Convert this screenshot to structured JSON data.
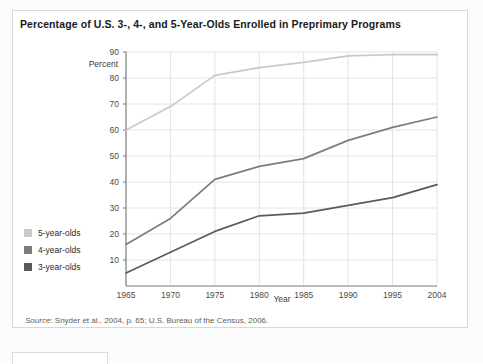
{
  "figure": {
    "title": "Percentage of U.S. 3-, 4-, and 5-Year-Olds Enrolled in Preprimary Programs",
    "source_prefix": "Source",
    "source_text": ": Snyder et al., 2004, p. 65; U.S. Bureau of the Census, 2006."
  },
  "colors": {
    "five_year_olds": "#c9c9c9",
    "four_year_olds": "#7d7d7d",
    "three_year_olds": "#5a5a5a",
    "gridline": "#e3e3e3",
    "axis": "#7a7a7a",
    "card_border": "#d8d8d8",
    "page_background": "#fbfbfb",
    "card_background": "#ffffff"
  },
  "chart_data": {
    "type": "line",
    "title": "Percentage of U.S. 3-, 4-, and 5-Year-Olds Enrolled in Preprimary Programs",
    "xlabel": "Year",
    "ylabel": "Percent",
    "x": [
      1965,
      1970,
      1975,
      1980,
      1985,
      1990,
      1995,
      2004
    ],
    "xtick_labels": [
      "1965",
      "1970",
      "1975",
      "1980",
      "1985",
      "1990",
      "1995",
      "2004"
    ],
    "ytick_labels": [
      "10",
      "20",
      "30",
      "40",
      "50",
      "60",
      "70",
      "80",
      "90"
    ],
    "yticks": [
      10,
      20,
      30,
      40,
      50,
      60,
      70,
      80,
      90
    ],
    "ylim": [
      0,
      90
    ],
    "grid": true,
    "legend_position": "left-outside",
    "series": [
      {
        "name": "5-year-olds",
        "color": "#c9c9c9",
        "values": [
          60,
          69,
          81,
          84,
          86,
          88.5,
          89,
          89
        ]
      },
      {
        "name": "4-year-olds",
        "color": "#7d7d7d",
        "values": [
          16,
          26,
          41,
          46,
          49,
          56,
          61,
          65
        ]
      },
      {
        "name": "3-year-olds",
        "color": "#5a5a5a",
        "values": [
          5,
          13,
          21,
          27,
          28,
          31,
          34,
          39
        ]
      }
    ]
  },
  "legend": {
    "items": [
      {
        "label": "5-year-olds",
        "color": "#c9c9c9"
      },
      {
        "label": "4-year-olds",
        "color": "#7d7d7d"
      },
      {
        "label": "3-year-olds",
        "color": "#5a5a5a"
      }
    ]
  }
}
